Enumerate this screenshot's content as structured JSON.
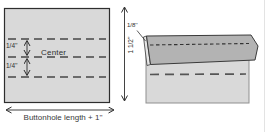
{
  "diagram": {
    "labels": {
      "quarter_top": "1/4''",
      "quarter_bottom": "1/4''",
      "center": "Center",
      "height": "1 1/2''",
      "fold": "1/8''",
      "length": "Buttonhole length + 1''"
    },
    "colors": {
      "fabric_light": "#d9d9d9",
      "fabric_fold": "#b3b3b3",
      "fold_edge": "#e6e6e6",
      "outline_dark": "#2e2e2e",
      "edge_gray": "#8f8f8f",
      "text": "#2f2f2f",
      "background": "#ffffff"
    }
  }
}
